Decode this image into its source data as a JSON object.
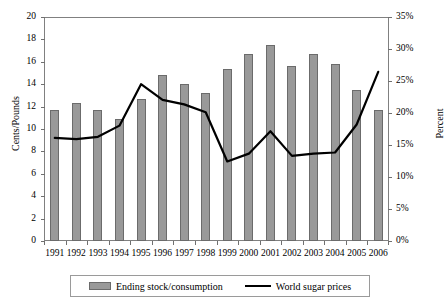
{
  "chart_data": {
    "type": "bar",
    "title": "",
    "subtitle": "",
    "categories": [
      "1991",
      "1992",
      "1993",
      "1994",
      "1995",
      "1996",
      "1997",
      "1998",
      "1999",
      "2000",
      "2001",
      "2002",
      "2003",
      "2004",
      "2005",
      "2006"
    ],
    "xlabel": "",
    "grid": false,
    "legend_position": "bottom",
    "axes": {
      "left": {
        "label": "Cents/Pounds",
        "min": 0,
        "max": 20,
        "step": 2,
        "ticks": [
          "0",
          "2",
          "4",
          "6",
          "8",
          "10",
          "12",
          "14",
          "16",
          "18",
          "20"
        ]
      },
      "right": {
        "label": "Percent",
        "min": 0,
        "max": 35,
        "step": 5,
        "ticks": [
          "0%",
          "5%",
          "10%",
          "15%",
          "20%",
          "25%",
          "30%",
          "35%"
        ]
      }
    },
    "series": [
      {
        "name": "Ending stock/consumption",
        "type": "bar",
        "axis": "right",
        "unit": "percent",
        "color": "#999999",
        "values": [
          20.4,
          21.5,
          20.5,
          19.1,
          22.2,
          26.0,
          24.5,
          23.1,
          26.8,
          29.2,
          30.7,
          27.3,
          29.2,
          27.6,
          23.6,
          20.4
        ]
      },
      {
        "name": "World sugar prices",
        "type": "line",
        "axis": "left",
        "unit": "cents_per_pound",
        "color": "#000000",
        "values": [
          9.2,
          9.1,
          9.3,
          10.3,
          14.0,
          12.6,
          12.2,
          11.5,
          7.1,
          7.8,
          9.8,
          7.6,
          7.8,
          7.9,
          10.4,
          15.1
        ]
      }
    ]
  },
  "legend": {
    "items": [
      {
        "label": "Ending stock/consumption",
        "marker": "bar-swatch"
      },
      {
        "label": "World sugar prices",
        "marker": "line-swatch"
      }
    ]
  }
}
